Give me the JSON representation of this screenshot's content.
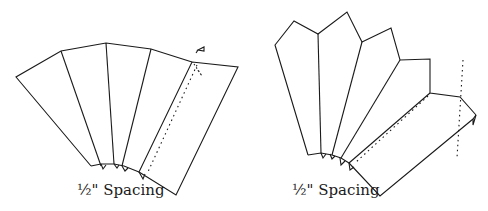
{
  "figures": [
    {
      "id": "left",
      "caption": "½\" Spacing",
      "description": "Fan of folded panels, straight-top variant"
    },
    {
      "id": "right",
      "caption": "½\" Spacing",
      "description": "Fan of folded panels, pointed-top variant"
    }
  ],
  "colors": {
    "stroke": "#1a1a1a",
    "background": "#ffffff"
  }
}
